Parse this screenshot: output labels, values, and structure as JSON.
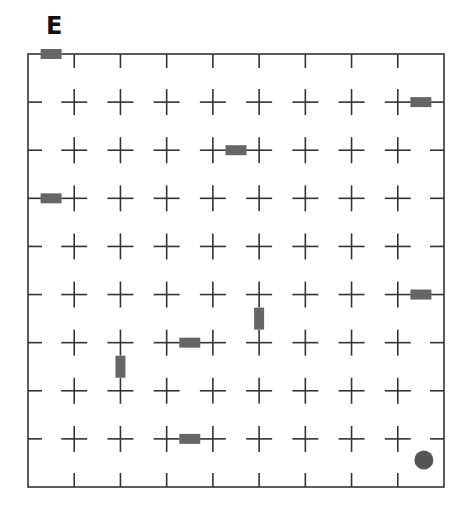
{
  "diagram": {
    "title": "E",
    "grid": {
      "cols": 9,
      "rows": 9,
      "frame": {
        "x0": 28,
        "y0": 54,
        "x1": 444,
        "y1": 487
      },
      "line_color": "#333333",
      "cross_half_length": 13,
      "edge_tick_length": 14
    },
    "walls": [
      {
        "orientation": "horizontal",
        "col": 0,
        "row_line": 0
      },
      {
        "orientation": "horizontal",
        "col": 8,
        "row_line": 1
      },
      {
        "orientation": "horizontal",
        "col": 4,
        "row_line": 2
      },
      {
        "orientation": "horizontal",
        "col": 0,
        "row_line": 3
      },
      {
        "orientation": "horizontal",
        "col": 8,
        "row_line": 5
      },
      {
        "orientation": "vertical",
        "col_line": 5,
        "row": 5
      },
      {
        "orientation": "horizontal",
        "col": 3,
        "row_line": 6
      },
      {
        "orientation": "vertical",
        "col_line": 2,
        "row": 6
      },
      {
        "orientation": "horizontal",
        "col": 3,
        "row_line": 8
      }
    ],
    "wall_color": "#666666",
    "marker": {
      "shape": "circle",
      "col": 8,
      "row": 8,
      "color": "#555555"
    }
  }
}
